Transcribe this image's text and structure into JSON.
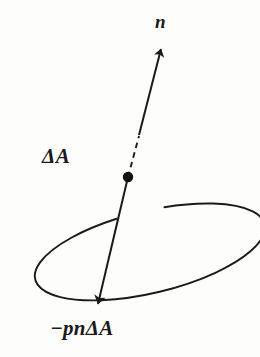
{
  "figure": {
    "kind": "vector-diagram",
    "background_color": "#fdfdfc",
    "ink_color": "#1a1a1a",
    "labels": {
      "normal_vector": "n",
      "area_element": "ΔA",
      "pressure_force": "−pnΔA"
    },
    "elements": {
      "surface_patch_name": "area-element-ellipse",
      "point_name": "surface-point-dot",
      "normal_arrow_name": "normal-vector-arrow",
      "force_arrow_name": "pressure-force-arrow",
      "hidden_segment_name": "normal-hidden-dashed-segment"
    }
  },
  "geometry": {
    "ellipse": {
      "cx": 131,
      "cy": 174,
      "rx": 118,
      "ry": 41,
      "rotation_deg": -13.5
    },
    "dot": {
      "cx": 128,
      "cy": 177,
      "r": 5.2
    },
    "normal_arrow": {
      "x1": 139,
      "y1": 135,
      "x2": 161,
      "y2": 49
    },
    "hidden_dash": {
      "x1": 128,
      "y1": 177,
      "x2": 139,
      "y2": 136
    },
    "force_arrow": {
      "x1": 128,
      "y1": 177,
      "x2": 98,
      "y2": 304
    }
  }
}
